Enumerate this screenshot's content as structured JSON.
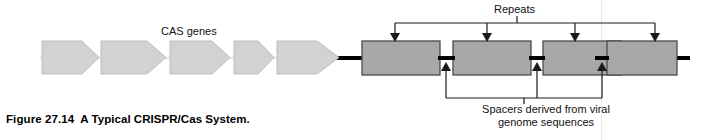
{
  "figure": {
    "number": "Figure 27.14",
    "title": "A Typical CRISPR/Cas System."
  },
  "labels": {
    "cas_genes": "CAS genes",
    "repeats": "Repeats",
    "spacers_line1": "Spacers derived from viral",
    "spacers_line2": "genome sequences"
  },
  "colors": {
    "gene_fill": "#d2d2d2",
    "gene_stroke": "#b4b4b4",
    "repeat_fill": "#a8a8a8",
    "repeat_stroke": "#4a4a4a",
    "dna_line": "#000000",
    "leader_line": "#1a1a1a",
    "text": "#111111",
    "background": "#ffffff"
  },
  "diagram": {
    "type": "crispr-cas-locus-schematic",
    "backbone": {
      "y": 58,
      "x_start": 40,
      "x_end": 690,
      "thin_stroke": 1.2,
      "thick_stroke": 4
    },
    "cas_genes": [
      {
        "name": "cas-gene-1",
        "x": 42,
        "y": 40,
        "body_width": 40,
        "head_width": 17,
        "height": 33
      },
      {
        "name": "cas-gene-2",
        "x": 101,
        "y": 40,
        "body_width": 46,
        "head_width": 19,
        "height": 33
      },
      {
        "name": "cas-gene-3",
        "x": 170,
        "y": 40,
        "body_width": 42,
        "head_width": 18,
        "height": 33
      },
      {
        "name": "cas-gene-4",
        "x": 234,
        "y": 40,
        "body_width": 24,
        "head_width": 16,
        "height": 33
      },
      {
        "name": "cas-gene-5",
        "x": 275,
        "y": 40,
        "body_width": 40,
        "head_width": 22,
        "height": 33
      }
    ],
    "repeats": [
      {
        "name": "repeat-1",
        "x": 362,
        "y": 41,
        "width": 78,
        "height": 34
      },
      {
        "name": "repeat-2",
        "x": 453,
        "y": 41,
        "width": 78,
        "height": 34
      },
      {
        "name": "repeat-3",
        "x": 543,
        "y": 41,
        "width": 78,
        "height": 34
      },
      {
        "name": "repeat-4",
        "x": 607,
        "y": 41,
        "width": 70,
        "height": 34
      }
    ],
    "spacers": [
      {
        "name": "spacer-1",
        "x1": 440,
        "x2": 453,
        "y": 58
      },
      {
        "name": "spacer-2",
        "x1": 531,
        "x2": 543,
        "y": 58
      },
      {
        "name": "spacer-3",
        "x1": 597,
        "x2": 607,
        "y": 58
      }
    ],
    "repeat_pointers_x": [
      395,
      487,
      575,
      655
    ],
    "repeat_bracket": {
      "y": 23,
      "x_left": 395,
      "x_right": 655,
      "stem_x": 517,
      "stem_top": 16
    },
    "spacer_pointers_x": [
      446,
      537,
      602
    ],
    "spacer_bracket": {
      "y": 98,
      "x_left": 446,
      "x_right": 602,
      "stem_x": 524,
      "stem_bottom": 104
    },
    "scanline_x": 601
  }
}
